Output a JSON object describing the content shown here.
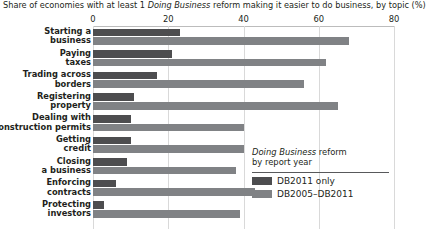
{
  "chart_data": {
    "type": "bar",
    "orientation": "horizontal",
    "title": "Share of economies with at least 1 Doing Business reform making it easier to do business, by topic (%)",
    "title_parts": {
      "before_italic": "Share of economies with at least 1 ",
      "italic": "Doing Business",
      "after_italic": " reform making it easier to do business, by topic (%)"
    },
    "xlabel": "",
    "ylabel": "",
    "xlim": [
      0,
      80
    ],
    "xticks": [
      0,
      20,
      40,
      60,
      80
    ],
    "xtick_labels": [
      "0",
      "20",
      "40",
      "60",
      "80"
    ],
    "grid": true,
    "legend_position": "inside-right",
    "categories": [
      "Starting a\nbusiness",
      "Paying\ntaxes",
      "Trading across\nborders",
      "Registering\nproperty",
      "Dealing with\nconstruction permits",
      "Getting\ncredit",
      "Closing\na business",
      "Enforcing\ncontracts",
      "Protecting\ninvestors"
    ],
    "series": [
      {
        "name": "DB2011 only",
        "color": "#4d4d4f",
        "values": [
          23,
          21,
          17,
          11,
          10,
          10,
          9,
          6,
          3
        ]
      },
      {
        "name": "DB2005–DB2011",
        "color": "#808285",
        "values": [
          68,
          62,
          56,
          65,
          40,
          40,
          38,
          43,
          39
        ]
      }
    ]
  },
  "legend": {
    "title_line1_italic": "Doing Business",
    "title_line1_rest": " reform",
    "title_line2": "by report year",
    "items": [
      {
        "label": "DB2011 only",
        "color": "#4d4d4f"
      },
      {
        "label": "DB2005–DB2011",
        "color": "#808285"
      }
    ]
  }
}
